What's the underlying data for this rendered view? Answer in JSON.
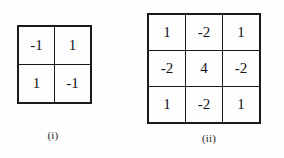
{
  "page": {
    "background_color": "#fefefe",
    "ink_color": "#141414",
    "border_color": "#1a1a1a"
  },
  "figures": [
    {
      "id": "i",
      "caption": "(i)",
      "kind": "matrix",
      "rows": 2,
      "cols": 2,
      "cells": [
        [
          "-1",
          "1"
        ],
        [
          "1",
          "-1"
        ]
      ]
    },
    {
      "id": "ii",
      "caption": "(ii)",
      "kind": "matrix",
      "rows": 3,
      "cols": 3,
      "cells": [
        [
          "1",
          "-2",
          "1"
        ],
        [
          "-2",
          "4",
          "-2"
        ],
        [
          "1",
          "-2",
          "1"
        ]
      ]
    }
  ]
}
